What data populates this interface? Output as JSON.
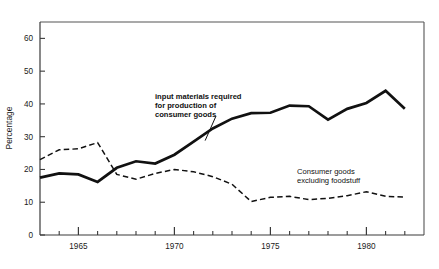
{
  "chart_data": {
    "type": "line",
    "title": "",
    "subtitle": "",
    "xlabel": "",
    "ylabel": "Percentage",
    "xlim": [
      1963,
      1983
    ],
    "ylim": [
      0,
      65
    ],
    "grid": false,
    "legend_position": "inline-annotations",
    "y_ticks": [
      0,
      10,
      20,
      30,
      40,
      50,
      60
    ],
    "y_tick_labels": [
      "0",
      "10",
      "20",
      "30",
      "40",
      "50",
      "60"
    ],
    "x_tick_labels": [
      "1965",
      "1970",
      "1975",
      "1980"
    ],
    "x_major_ticks": [
      1965,
      1970,
      1975,
      1980
    ],
    "x_minor_ticks": [
      1964,
      1966,
      1967,
      1968,
      1969,
      1971,
      1972,
      1973,
      1974,
      1976,
      1977,
      1978,
      1979,
      1981,
      1982
    ],
    "x": [
      1963,
      1964,
      1965,
      1966,
      1967,
      1968,
      1969,
      1970,
      1971,
      1972,
      1973,
      1974,
      1975,
      1976,
      1977,
      1978,
      1979,
      1980,
      1981,
      1982
    ],
    "series": [
      {
        "name": "input materials required for production of consumer goods",
        "style": "solid",
        "values": [
          17.5,
          18.8,
          18.5,
          16.2,
          20.5,
          22.5,
          21.8,
          24.5,
          28.5,
          32.5,
          35.5,
          37.2,
          37.3,
          39.5,
          39.3,
          35.2,
          38.5,
          40.3,
          44.0,
          38.5
        ]
      },
      {
        "name": "Consumer goods excluding foodstuff",
        "style": "dashed",
        "values": [
          23.0,
          26.0,
          26.3,
          28.2,
          18.5,
          17.0,
          18.8,
          20.0,
          19.3,
          17.8,
          15.5,
          10.2,
          11.5,
          11.8,
          10.8,
          11.2,
          12.0,
          13.2,
          11.8,
          11.6
        ]
      }
    ],
    "annotations": [
      {
        "id": "annotation-input-materials",
        "lines": [
          "input materials required",
          "for production of",
          "consumer  goods"
        ],
        "x": 1971.2,
        "y": 47.5,
        "leader": true
      },
      {
        "id": "annotation-consumer-goods",
        "lines": [
          "Consumer  goods",
          "excluding foodstuff"
        ],
        "x": 1977.0,
        "y": 21.0,
        "leader": false
      }
    ]
  }
}
